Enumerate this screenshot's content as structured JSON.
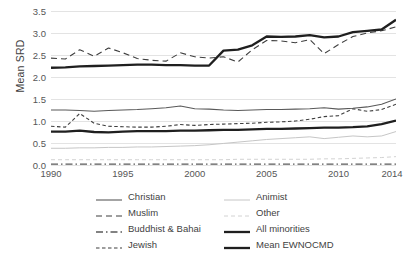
{
  "chart_data": {
    "type": "line",
    "title": "",
    "xlabel": "",
    "ylabel": "Mean SRD",
    "xlim": [
      1990,
      2014
    ],
    "ylim": [
      0.0,
      3.5
    ],
    "grid": true,
    "legend_position": "bottom",
    "ytick_labels": [
      "3.5",
      "3.0",
      "2.5",
      "2.0",
      "1.5",
      "1.0",
      "0.5",
      "0.0"
    ],
    "ytick_values": [
      3.5,
      3.0,
      2.5,
      2.0,
      1.5,
      1.0,
      0.5,
      0.0
    ],
    "xtick_labels": [
      "1990",
      "1995",
      "2000",
      "2005",
      "2010",
      "2014"
    ],
    "xtick_values": [
      1990,
      1995,
      2000,
      2005,
      2010,
      2014
    ],
    "x": [
      1990,
      1991,
      1992,
      1993,
      1994,
      1995,
      1996,
      1997,
      1998,
      1999,
      2000,
      2001,
      2002,
      2003,
      2004,
      2005,
      2006,
      2007,
      2008,
      2009,
      2010,
      2011,
      2012,
      2013,
      2014
    ],
    "series": [
      {
        "name": "Christian",
        "style": "solid-thin",
        "color": "#595959",
        "values": [
          1.25,
          1.25,
          1.24,
          1.22,
          1.24,
          1.25,
          1.26,
          1.28,
          1.3,
          1.34,
          1.28,
          1.27,
          1.25,
          1.24,
          1.25,
          1.26,
          1.26,
          1.27,
          1.28,
          1.3,
          1.27,
          1.29,
          1.32,
          1.38,
          1.5
        ]
      },
      {
        "name": "Muslim",
        "style": "dashed-long",
        "color": "#3f3f3f",
        "values": [
          2.43,
          2.41,
          2.62,
          2.47,
          2.66,
          2.55,
          2.42,
          2.38,
          2.36,
          2.55,
          2.46,
          2.43,
          2.46,
          2.34,
          2.62,
          2.83,
          2.82,
          2.78,
          2.85,
          2.53,
          2.74,
          2.92,
          3.0,
          3.05,
          3.14
        ]
      },
      {
        "name": "Buddhist & Bahai",
        "style": "dash-dot",
        "color": "#5a5a5a",
        "values": [
          0.02,
          0.02,
          0.02,
          0.02,
          0.02,
          0.02,
          0.02,
          0.02,
          0.02,
          0.02,
          0.02,
          0.02,
          0.02,
          0.02,
          0.02,
          0.02,
          0.02,
          0.02,
          0.02,
          0.02,
          0.02,
          0.02,
          0.02,
          0.02,
          0.02
        ]
      },
      {
        "name": "Jewish",
        "style": "dashed-short",
        "color": "#3f3f3f",
        "values": [
          0.88,
          0.86,
          1.17,
          0.95,
          0.88,
          0.87,
          0.86,
          0.86,
          0.88,
          0.92,
          0.9,
          0.92,
          0.93,
          0.94,
          0.95,
          0.97,
          0.98,
          1.0,
          1.04,
          1.1,
          1.12,
          1.28,
          1.22,
          1.26,
          1.38
        ]
      },
      {
        "name": "Animist",
        "style": "solid-light",
        "color": "#c6c6c6",
        "values": [
          0.38,
          0.38,
          0.39,
          0.39,
          0.4,
          0.4,
          0.41,
          0.41,
          0.42,
          0.43,
          0.44,
          0.46,
          0.49,
          0.52,
          0.55,
          0.58,
          0.6,
          0.62,
          0.64,
          0.6,
          0.63,
          0.66,
          0.64,
          0.66,
          0.76
        ]
      },
      {
        "name": "Other",
        "style": "dashed-light",
        "color": "#d2d2d2",
        "values": [
          0.12,
          0.12,
          0.12,
          0.12,
          0.12,
          0.12,
          0.12,
          0.12,
          0.12,
          0.12,
          0.12,
          0.12,
          0.12,
          0.13,
          0.13,
          0.13,
          0.13,
          0.13,
          0.13,
          0.14,
          0.14,
          0.15,
          0.16,
          0.17,
          0.19
        ]
      },
      {
        "name": "All minorities",
        "style": "solid-thick",
        "color": "#1f1f1f",
        "values": [
          0.76,
          0.76,
          0.78,
          0.75,
          0.74,
          0.76,
          0.77,
          0.77,
          0.77,
          0.78,
          0.78,
          0.79,
          0.8,
          0.8,
          0.81,
          0.82,
          0.82,
          0.83,
          0.84,
          0.85,
          0.85,
          0.86,
          0.88,
          0.93,
          1.01
        ]
      },
      {
        "name": "Mean EWNOCMD",
        "style": "solid-thick",
        "color": "#1f1f1f",
        "values": [
          2.21,
          2.22,
          2.24,
          2.25,
          2.26,
          2.27,
          2.28,
          2.28,
          2.27,
          2.27,
          2.26,
          2.26,
          2.6,
          2.62,
          2.72,
          2.92,
          2.91,
          2.92,
          2.95,
          2.9,
          2.92,
          3.02,
          3.05,
          3.08,
          3.3
        ]
      }
    ]
  },
  "legend": {
    "items": [
      {
        "label": "Christian",
        "style": "solid-thin"
      },
      {
        "label": "Animist",
        "style": "solid-light"
      },
      {
        "label": "Muslim",
        "style": "dashed-long"
      },
      {
        "label": "Other",
        "style": "dashed-light"
      },
      {
        "label": "Buddhist & Bahai",
        "style": "dash-dot"
      },
      {
        "label": "All minorities",
        "style": "solid-thick"
      },
      {
        "label": "Jewish",
        "style": "dashed-short"
      },
      {
        "label": "Mean EWNOCMD",
        "style": "solid-thick"
      }
    ]
  }
}
